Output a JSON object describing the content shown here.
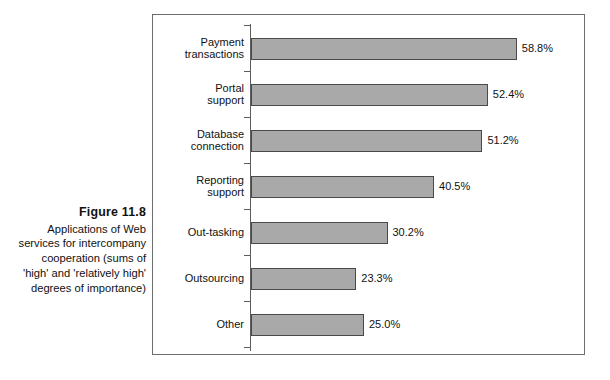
{
  "caption": {
    "figure_number": "Figure 11.8",
    "text": "Applications of Web services for intercompany cooperation (sums of 'high' and 'relatively high' degrees of importance)"
  },
  "chart_data": {
    "type": "bar",
    "orientation": "horizontal",
    "title": "",
    "subtitle": "",
    "xlabel": "",
    "ylabel": "",
    "grid": false,
    "legend": "none",
    "xlim": [
      0,
      62
    ],
    "value_suffix": "%",
    "categories": [
      "Payment\ntransactions",
      "Portal\nsupport",
      "Database\nconnection",
      "Reporting\nsupport",
      "Out-tasking",
      "Outsourcing",
      "Other"
    ],
    "values": [
      58.8,
      52.4,
      51.2,
      40.5,
      30.2,
      23.3,
      25.0
    ],
    "value_labels": [
      "58.8%",
      "52.4%",
      "51.2%",
      "40.5%",
      "30.2%",
      "23.3%",
      "25.0%"
    ],
    "bar_fill": "#a9a9a9",
    "bar_stroke": "#4a4a4a",
    "axis_color": "#5c5c5c"
  }
}
